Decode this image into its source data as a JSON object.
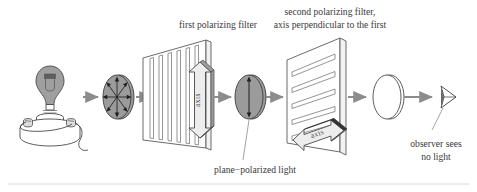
{
  "figure": {
    "title_labels": {
      "first_filter": "first polarizing filter",
      "second_filter_line1": "second polarizing filter,",
      "second_filter_line2": "axis perpendicular to the first",
      "plane_polarized": "plane−polarized light",
      "observer_line1": "observer sees",
      "observer_line2": "no light"
    },
    "axis_labels": {
      "first": "axis",
      "second": "axis"
    },
    "elements": {
      "source": "light-bulb",
      "beam1": "unpolarized-light-ellipse",
      "filter1": "first-polarizing-filter",
      "beam2": "plane-polarized-light-ellipse",
      "filter2": "second-polarizing-filter",
      "beam3": "no-light-ellipse",
      "observer": "observer-eye"
    },
    "colors": {
      "outline": "#5a5a5a",
      "bulb_glass": "#9a9a9a",
      "beam_fill": "#9b9b9b",
      "arrow_gray": "#8c8c8c",
      "arrow_fill": "#e8e8e8",
      "text": "#3a3a3a",
      "rule": "#d8d8d8",
      "panel_fill": "#ffffff"
    }
  }
}
